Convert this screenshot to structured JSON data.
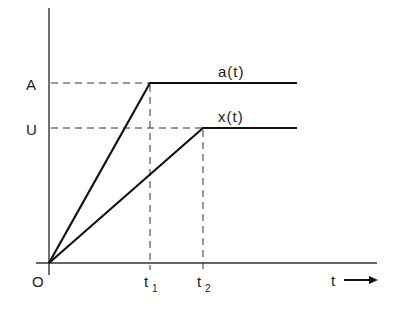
{
  "diagram": {
    "type": "piecewise-linear signal plot",
    "axes": {
      "origin_label": "O",
      "x_axis_label": "t",
      "x_ticks": [
        {
          "label": "t",
          "sub": "1"
        },
        {
          "label": "t",
          "sub": "2"
        }
      ],
      "y_ticks": [
        {
          "label": "A"
        },
        {
          "label": "U"
        }
      ]
    },
    "curves": [
      {
        "name": "a(t)",
        "label": "a(t)",
        "description": "ramps linearly from O to A at t1, then constant at A"
      },
      {
        "name": "x(t)",
        "label": "x(t)",
        "description": "ramps linearly from O to U at t2, then constant at U"
      }
    ],
    "colors": {
      "ink": "#1a1a1a",
      "background": "#ffffff"
    }
  }
}
